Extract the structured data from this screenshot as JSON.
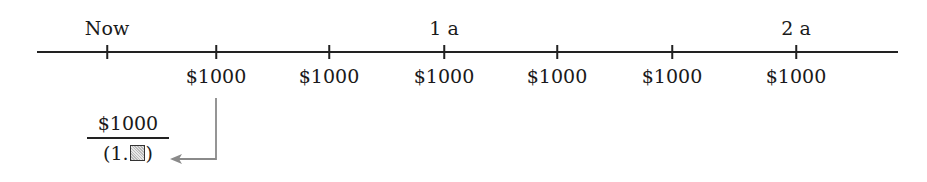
{
  "timeline": {
    "period_labels": [
      {
        "text": "Now",
        "x": 107
      },
      {
        "text": "1 a",
        "x": 444
      },
      {
        "text": "2 a",
        "x": 796
      }
    ],
    "ticks": [
      107,
      216,
      329,
      444,
      557,
      672,
      796
    ],
    "payments": [
      {
        "text": "$1000",
        "x": 216
      },
      {
        "text": "$1000",
        "x": 329
      },
      {
        "text": "$1000",
        "x": 444
      },
      {
        "text": "$1000",
        "x": 557
      },
      {
        "text": "$1000",
        "x": 672
      },
      {
        "text": "$1000",
        "x": 796
      }
    ]
  },
  "discount": {
    "numerator": "$1000",
    "denominator_prefix": "(1.",
    "denominator_suffix": ")",
    "placeholder_icon": "shaded-box"
  },
  "colors": {
    "axis": "#222222",
    "arrow": "#8a8a8a"
  }
}
